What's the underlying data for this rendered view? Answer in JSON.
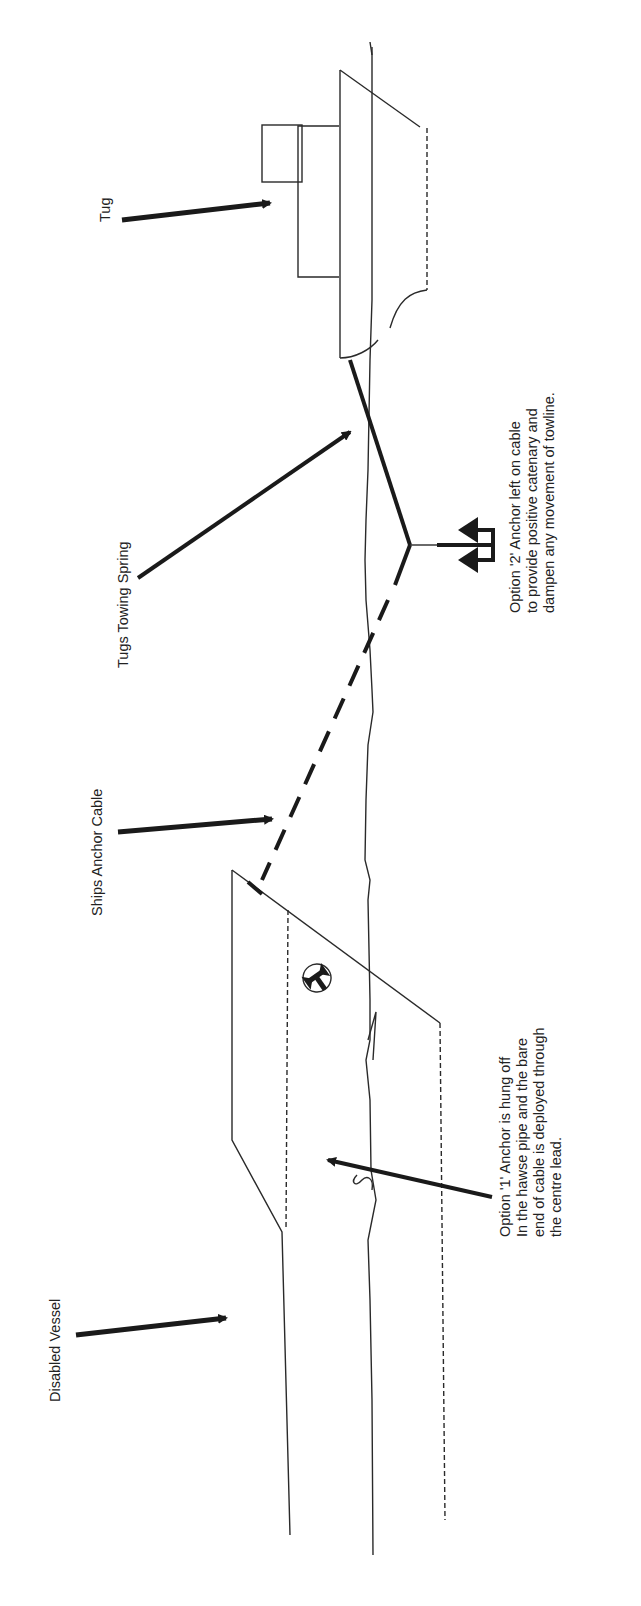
{
  "diagram": {
    "orientation": "rotated-90-ccw",
    "background": "#ffffff",
    "ink_color": "#1a1a1a",
    "labels": {
      "tug": "Tug",
      "towing_spring": "Tugs Towing Spring",
      "anchor_cable": "Ships Anchor Cable",
      "disabled_vessel": "Disabled Vessel",
      "option2": {
        "line1": "Option '2' Anchor left on cable",
        "line2": "to provide positive catenary and",
        "line3": "dampen any movement of towline."
      },
      "option1": {
        "line1": "Option '1' Anchor is hung off",
        "line2": "In the hawse pipe and the bare",
        "line3": "end of cable is deployed through",
        "line4": "the centre lead."
      }
    },
    "elements": [
      "tug-hull",
      "tug-wheelhouse",
      "tug-superstructure",
      "waterline",
      "towing-spring",
      "anchor-option-2",
      "anchor-cable",
      "disabled-vessel-hull",
      "anchor-hawse-symbol"
    ]
  }
}
